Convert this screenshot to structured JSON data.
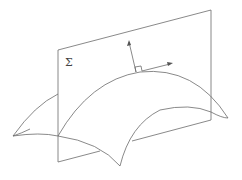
{
  "diagram": {
    "plane_label": "Σ",
    "line_color": "#6b6b6b",
    "elements": [
      "plane Σ",
      "curved surface",
      "normal vector",
      "tangent vector",
      "right-angle marker"
    ]
  }
}
